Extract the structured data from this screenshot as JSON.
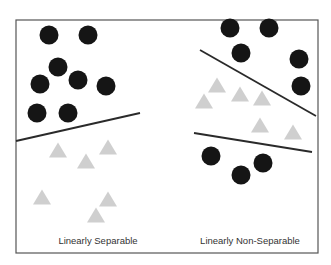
{
  "colors": {
    "frame": "#555555",
    "circle": "#151515",
    "triangle": "#cfcfcf",
    "line": "#2a2a2a",
    "caption": "#333333"
  },
  "frame": {
    "x": 16,
    "y": 20,
    "width": 302,
    "height": 233
  },
  "panels": [
    {
      "name": "linearly-separable",
      "caption": "Linearly Separable",
      "caption_pos": {
        "x": 98,
        "y": 244
      },
      "circles": [
        {
          "cx": 49,
          "cy": 35
        },
        {
          "cx": 88,
          "cy": 35
        },
        {
          "cx": 58,
          "cy": 67
        },
        {
          "cx": 40,
          "cy": 84
        },
        {
          "cx": 78,
          "cy": 80
        },
        {
          "cx": 106,
          "cy": 86
        },
        {
          "cx": 37,
          "cy": 113
        },
        {
          "cx": 68,
          "cy": 113
        }
      ],
      "triangles": [
        {
          "cx": 58,
          "cy": 150
        },
        {
          "cx": 86,
          "cy": 161
        },
        {
          "cx": 108,
          "cy": 147
        },
        {
          "cx": 42,
          "cy": 197
        },
        {
          "cx": 108,
          "cy": 199
        },
        {
          "cx": 96,
          "cy": 215
        }
      ],
      "lines": [
        {
          "x1": 16,
          "y1": 141,
          "x2": 140,
          "y2": 113
        }
      ]
    },
    {
      "name": "linearly-non-separable",
      "caption": "Linearly Non-Separable",
      "caption_pos": {
        "x": 250,
        "y": 244
      },
      "circles": [
        {
          "cx": 230,
          "cy": 28
        },
        {
          "cx": 269,
          "cy": 28
        },
        {
          "cx": 241,
          "cy": 53
        },
        {
          "cx": 299,
          "cy": 59
        },
        {
          "cx": 301,
          "cy": 86
        },
        {
          "cx": 211,
          "cy": 156
        },
        {
          "cx": 241,
          "cy": 175
        },
        {
          "cx": 263,
          "cy": 163
        }
      ],
      "triangles": [
        {
          "cx": 217,
          "cy": 85
        },
        {
          "cx": 204,
          "cy": 101
        },
        {
          "cx": 240,
          "cy": 94
        },
        {
          "cx": 262,
          "cy": 98
        },
        {
          "cx": 260,
          "cy": 125
        },
        {
          "cx": 293,
          "cy": 132
        }
      ],
      "lines": [
        {
          "x1": 200,
          "y1": 50,
          "x2": 316,
          "y2": 116
        },
        {
          "x1": 194,
          "y1": 133,
          "x2": 312,
          "y2": 152
        }
      ]
    }
  ]
}
